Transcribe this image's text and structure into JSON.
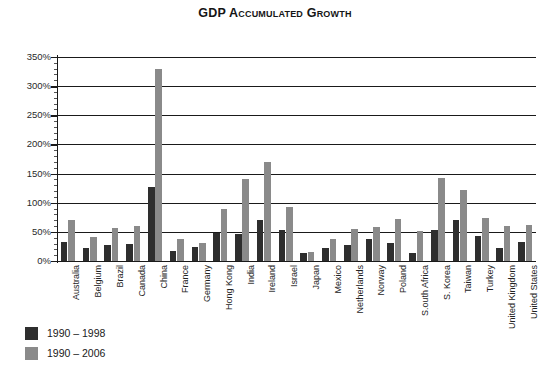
{
  "chart_data": {
    "type": "bar",
    "title": "GDP Accumulated Growth",
    "xlabel": "",
    "ylabel": "",
    "ylim": [
      0,
      350
    ],
    "ytick_labels": [
      "0%",
      "50%",
      "100%",
      "150%",
      "200%",
      "250%",
      "300%",
      "350%"
    ],
    "ytick_values": [
      0,
      50,
      100,
      150,
      200,
      250,
      300,
      350
    ],
    "ytick_step": 50,
    "minor_tick_step": 10,
    "grid": true,
    "grid_axis": "y",
    "legend_position": "below-left",
    "categories": [
      "Australia",
      "Belgium",
      "Brazil",
      "Canada",
      "China",
      "France",
      "Germany",
      "Hong Kong",
      "India",
      "Ireland",
      "Israel",
      "Japan",
      "Mexico",
      "Netherlands",
      "Norway",
      "Poland",
      "S.outh Africa",
      "S. Korea",
      "Taiwan",
      "Turkey",
      "United Kingdom",
      "United States"
    ],
    "series": [
      {
        "name": "1990 – 1998",
        "color": "#2e2e2e",
        "values": [
          32,
          22,
          28,
          29,
          127,
          18,
          24,
          48,
          47,
          70,
          53,
          13,
          23,
          27,
          38,
          31,
          14,
          53,
          71,
          43,
          22,
          33
        ]
      },
      {
        "name": "1990 – 2006",
        "color": "#8a8a8a",
        "values": [
          70,
          41,
          57,
          60,
          330,
          38,
          31,
          89,
          140,
          170,
          93,
          16,
          38,
          55,
          58,
          72,
          52,
          143,
          122,
          73,
          60,
          62
        ]
      }
    ]
  },
  "legend": {
    "items": [
      {
        "label": "1990 – 1998",
        "color": "#2e2e2e"
      },
      {
        "label": "1990 – 2006",
        "color": "#8a8a8a"
      }
    ]
  }
}
